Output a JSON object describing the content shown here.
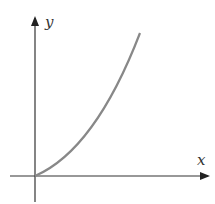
{
  "diagram": {
    "type": "function-graph",
    "axes": {
      "x_label": "x",
      "y_label": "y"
    },
    "colors": {
      "axis": "#222222",
      "curve": "#888888",
      "label": "#333333"
    },
    "curve": {
      "start": [
        0,
        0
      ],
      "shape": "concave-up increasing"
    }
  }
}
